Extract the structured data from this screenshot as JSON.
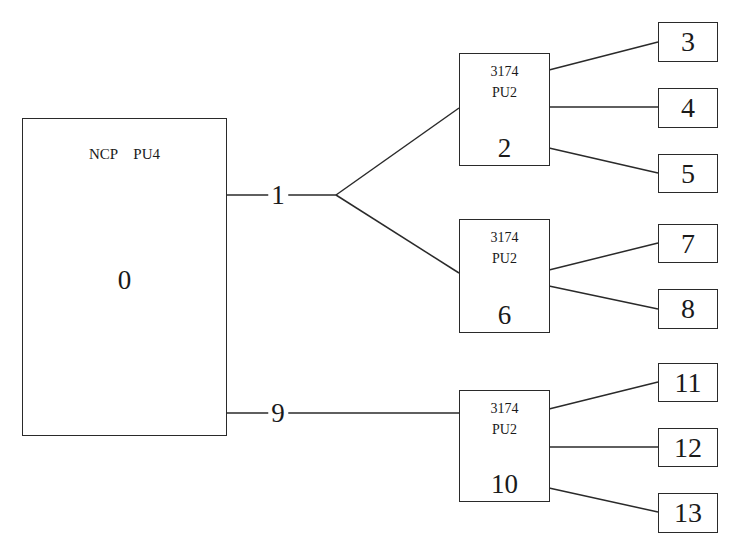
{
  "diagram": {
    "type": "network-topology",
    "stroke_color": "#2a2a2a",
    "background": "#ffffff",
    "host": {
      "title": "NCP   PU4",
      "id": "0"
    },
    "links": [
      {
        "id": "1",
        "from": "0",
        "to": [
          "2",
          "6"
        ]
      },
      {
        "id": "9",
        "from": "0",
        "to": [
          "10"
        ]
      }
    ],
    "controllers": [
      {
        "model": "3174",
        "pu": "PU2",
        "id": "2",
        "terminals": [
          "3",
          "4",
          "5"
        ]
      },
      {
        "model": "3174",
        "pu": "PU2",
        "id": "6",
        "terminals": [
          "7",
          "8"
        ]
      },
      {
        "model": "3174",
        "pu": "PU2",
        "id": "10",
        "terminals": [
          "11",
          "12",
          "13"
        ]
      }
    ],
    "terminals": [
      "3",
      "4",
      "5",
      "7",
      "8",
      "11",
      "12",
      "13"
    ]
  }
}
